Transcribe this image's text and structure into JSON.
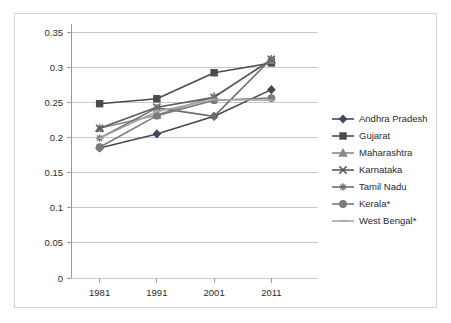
{
  "chart_data": {
    "type": "line",
    "title": "",
    "subtitle": "",
    "xlabel": "",
    "ylabel": "",
    "categories": [
      "1981",
      "1991",
      "2001",
      "2011"
    ],
    "x": [
      1981,
      1991,
      2001,
      2011
    ],
    "ylim": [
      0,
      0.35
    ],
    "y_ticks": [
      "0",
      "0.05",
      "0.1",
      "0.15",
      "0.2",
      "0.25",
      "0.3",
      "0.35"
    ],
    "y_tick_values": [
      0,
      0.05,
      0.1,
      0.15,
      0.2,
      0.25,
      0.3,
      0.35
    ],
    "grid": true,
    "legend_position": "right",
    "series": [
      {
        "name": "Andhra Pradesh",
        "marker": "diamond",
        "color": "#3f4a5a",
        "values": [
          0.185,
          0.205,
          0.23,
          0.268
        ]
      },
      {
        "name": "Gujarat",
        "marker": "square",
        "color": "#4a4a52",
        "values": [
          0.248,
          0.255,
          0.292,
          0.306
        ]
      },
      {
        "name": "Maharashtra",
        "marker": "triangle",
        "color": "#8a8a8a",
        "values": [
          0.213,
          0.232,
          0.258,
          0.31
        ]
      },
      {
        "name": "Karnataka",
        "marker": "cross",
        "color": "#5c5c5c",
        "values": [
          0.213,
          0.243,
          0.257,
          0.311
        ]
      },
      {
        "name": "Tamil Nadu",
        "marker": "star",
        "color": "#6e6e6e",
        "values": [
          0.199,
          0.242,
          0.23,
          0.312
        ]
      },
      {
        "name": "Kerala*",
        "marker": "circle",
        "color": "#7b7b7b",
        "values": [
          0.186,
          0.231,
          0.253,
          0.256
        ]
      },
      {
        "name": "West Bengal*",
        "marker": "line",
        "color": "#a6a6a6",
        "values": [
          0.199,
          0.237,
          0.254,
          0.253
        ]
      }
    ]
  },
  "legend": {
    "items": [
      {
        "label": "Andhra Pradesh"
      },
      {
        "label": "Gujarat"
      },
      {
        "label": "Maharashtra"
      },
      {
        "label": "Karnataka"
      },
      {
        "label": "Tamil Nadu"
      },
      {
        "label": "Kerala*"
      },
      {
        "label": "West Bengal*"
      }
    ]
  }
}
